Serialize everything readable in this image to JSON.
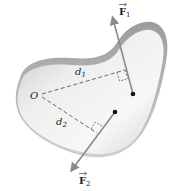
{
  "diagram": {
    "title": "",
    "body": {
      "fill_light": "#f2f2f2",
      "fill_dark": "#bdbdbd",
      "edge": "#a8a8a8"
    },
    "labels": {
      "origin": "O",
      "d1": "d",
      "d1_sub": "1",
      "d2": "d",
      "d2_sub": "2",
      "F1": "F",
      "F1_sub": "1",
      "F2": "F",
      "F2_sub": "2"
    },
    "colors": {
      "arrow": "#8a8a8a",
      "dashed": "#444444",
      "point": "#111111",
      "text": "#222222"
    },
    "elements": [
      {
        "id": "origin-point",
        "label": "O",
        "x": 41,
        "y": 95
      },
      {
        "id": "force-1",
        "label": "F1",
        "from": [
          133,
          94
        ],
        "to": [
          112,
          14
        ]
      },
      {
        "id": "force-2",
        "label": "F2",
        "from": [
          115,
          112
        ],
        "to": [
          70,
          173
        ]
      },
      {
        "id": "moment-arm-1",
        "label": "d1",
        "from": [
          41,
          95
        ],
        "to": [
          125,
          70
        ]
      },
      {
        "id": "moment-arm-2",
        "label": "d2",
        "from": [
          41,
          95
        ],
        "to": [
          97,
          133
        ]
      }
    ]
  }
}
